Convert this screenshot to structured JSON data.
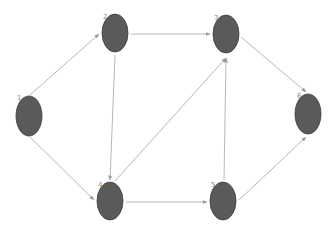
{
  "diagram": {
    "type": "directed-graph",
    "colors": {
      "node_fill": "#5a5a5a",
      "node_stroke": "#3e3e3e",
      "edge": "#b8b8b8",
      "arrow": "#9a9a9a",
      "label": "#888888",
      "background": "#ffffff"
    },
    "nodes": [
      {
        "id": "1",
        "label": "1",
        "cx": 29,
        "cy": 116,
        "rx": 13,
        "ry": 20,
        "lx": 17,
        "ly": 100
      },
      {
        "id": "2",
        "label": "2",
        "cx": 115,
        "cy": 33,
        "rx": 13,
        "ry": 19,
        "lx": 103,
        "ly": 19
      },
      {
        "id": "3",
        "label": "3",
        "cx": 226,
        "cy": 34,
        "rx": 13,
        "ry": 19,
        "lx": 214,
        "ly": 20
      },
      {
        "id": "4",
        "label": "4",
        "cx": 110,
        "cy": 201,
        "rx": 13,
        "ry": 19,
        "lx": 98,
        "ly": 187
      },
      {
        "id": "5",
        "label": "5",
        "cx": 223,
        "cy": 201,
        "rx": 13,
        "ry": 19,
        "lx": 211,
        "ly": 187
      },
      {
        "id": "6",
        "label": "6",
        "cx": 308,
        "cy": 114,
        "rx": 13,
        "ry": 20,
        "lx": 297,
        "ly": 98
      }
    ],
    "edges": [
      {
        "from": "1",
        "to": "2",
        "x1": 30,
        "y1": 95,
        "x2": 99,
        "y2": 34
      },
      {
        "from": "1",
        "to": "4",
        "x1": 30,
        "y1": 137,
        "x2": 94,
        "y2": 200
      },
      {
        "from": "2",
        "to": "3",
        "x1": 131,
        "y1": 34,
        "x2": 210,
        "y2": 34
      },
      {
        "from": "2",
        "to": "4",
        "x1": 115,
        "y1": 55,
        "x2": 110,
        "y2": 180
      },
      {
        "from": "4",
        "to": "3",
        "x1": 115,
        "y1": 181,
        "x2": 226,
        "y2": 58
      },
      {
        "from": "5",
        "to": "3",
        "x1": 224,
        "y1": 180,
        "x2": 226,
        "y2": 58
      },
      {
        "from": "3",
        "to": "6",
        "x1": 241,
        "y1": 37,
        "x2": 306,
        "y2": 92
      },
      {
        "from": "4",
        "to": "5",
        "x1": 126,
        "y1": 202,
        "x2": 207,
        "y2": 202
      },
      {
        "from": "5",
        "to": "6",
        "x1": 239,
        "y1": 200,
        "x2": 306,
        "y2": 137
      }
    ]
  }
}
